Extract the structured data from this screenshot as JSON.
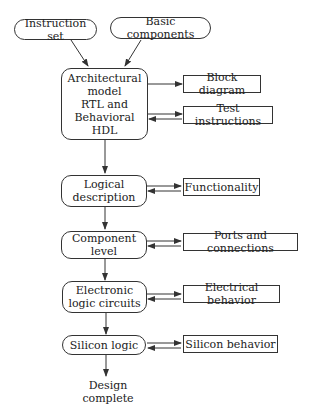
{
  "diagram": {
    "inputs": [
      {
        "id": "instruction-set",
        "label": "Instruction set"
      },
      {
        "id": "basic-components",
        "label": "Basic components"
      }
    ],
    "stages": [
      {
        "id": "architectural-model",
        "label": "Architectural\nmodel\nRTL  and\nBehavioral\nHDL"
      },
      {
        "id": "logical-description",
        "label": "Logical\ndescription"
      },
      {
        "id": "component-level",
        "label": "Component\nlevel"
      },
      {
        "id": "electronic-logic-circuits",
        "label": "Electronic\nlogic circuits"
      },
      {
        "id": "silicon-logic",
        "label": "Silicon logic"
      }
    ],
    "outputs": [
      {
        "id": "block-diagram",
        "label": "Block diagram",
        "stage": "architectural-model",
        "bidirectional": false
      },
      {
        "id": "test-instructions",
        "label": "Test instructions",
        "stage": "architectural-model",
        "bidirectional": true
      },
      {
        "id": "functionality",
        "label": "Functionality",
        "stage": "logical-description",
        "bidirectional": true
      },
      {
        "id": "ports-and-connections",
        "label": "Ports and connections",
        "stage": "component-level",
        "bidirectional": true
      },
      {
        "id": "electrical-behavior",
        "label": "Electrical behavior",
        "stage": "electronic-logic-circuits",
        "bidirectional": true
      },
      {
        "id": "silicon-behavior",
        "label": "Silicon behavior",
        "stage": "silicon-logic",
        "bidirectional": true
      }
    ],
    "final": {
      "label": "Design complete"
    }
  }
}
